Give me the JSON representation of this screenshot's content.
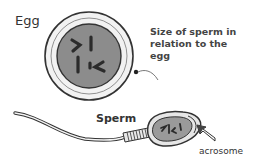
{
  "diagram": {
    "labels": {
      "egg": "Egg",
      "sperm": "Sperm",
      "size_note": "Size of sperm in relation to the egg",
      "acrosome": "acrosome"
    },
    "colors": {
      "outline": "#333333",
      "egg_outer": "#f2f2f2",
      "nucleus": "#8c8c8c",
      "chromosome": "#2b2b2b",
      "sperm_head": "#e6e6e6",
      "sperm_nucleus": "#9a9a9a",
      "acrosome_arrow": "#ffffff"
    }
  }
}
